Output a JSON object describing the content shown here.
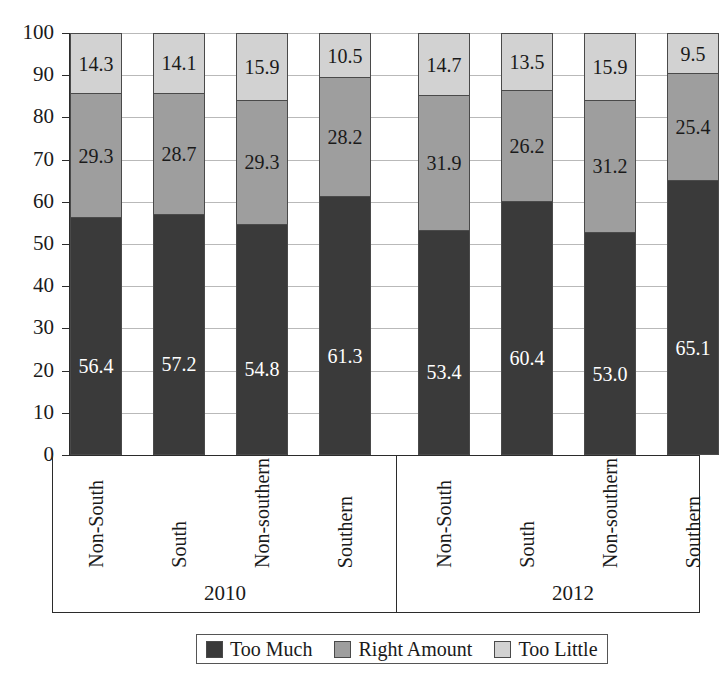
{
  "chart_data": {
    "type": "bar",
    "subtype": "stacked-bar-100",
    "title": "",
    "xlabel": "",
    "ylabel": "",
    "ylim": [
      0,
      100
    ],
    "ytick_labels": [
      "100",
      "90",
      "80",
      "70",
      "60",
      "50",
      "40",
      "30",
      "20",
      "10",
      "0"
    ],
    "ytick_values": [
      100,
      90,
      80,
      70,
      60,
      50,
      40,
      30,
      20,
      10,
      0
    ],
    "grid": true,
    "legend_position": "bottom",
    "groups": [
      "2010",
      "2012"
    ],
    "categories": [
      "Non-South",
      "South",
      "Non-southern",
      "Southern",
      "Non-South",
      "South",
      "Non-southern",
      "Southern"
    ],
    "series": [
      {
        "name": "Too Much",
        "color": "#3a3a3a",
        "values": [
          56.4,
          57.2,
          54.8,
          61.3,
          53.4,
          60.4,
          53.0,
          65.1
        ],
        "labels": [
          "56.4",
          "57.2",
          "54.8",
          "61.3",
          "53.4",
          "60.4",
          "53.0",
          "65.1"
        ]
      },
      {
        "name": "Right Amount",
        "color": "#9e9e9e",
        "values": [
          29.3,
          28.7,
          29.3,
          28.2,
          31.9,
          26.2,
          31.2,
          25.4
        ],
        "labels": [
          "29.3",
          "28.7",
          "29.3",
          "28.2",
          "31.9",
          "26.2",
          "31.2",
          "25.4"
        ]
      },
      {
        "name": "Too Little",
        "color": "#d2d2d2",
        "values": [
          14.3,
          14.1,
          15.9,
          10.5,
          14.7,
          13.5,
          15.9,
          9.5
        ],
        "labels": [
          "14.3",
          "14.1",
          "15.9",
          "10.5",
          "14.7",
          "13.5",
          "15.9",
          "9.5"
        ]
      }
    ]
  },
  "axis": {
    "ticks": [
      {
        "label": "100",
        "value": 100
      },
      {
        "label": "90",
        "value": 90
      },
      {
        "label": "80",
        "value": 80
      },
      {
        "label": "70",
        "value": 70
      },
      {
        "label": "60",
        "value": 60
      },
      {
        "label": "50",
        "value": 50
      },
      {
        "label": "40",
        "value": 40
      },
      {
        "label": "30",
        "value": 30
      },
      {
        "label": "20",
        "value": 20
      },
      {
        "label": "10",
        "value": 10
      },
      {
        "label": "0",
        "value": 0
      }
    ]
  },
  "bars": [
    {
      "group": "2010",
      "category": "Non-South",
      "too_much": "56.4",
      "right_amount": "29.3",
      "too_little": "14.3"
    },
    {
      "group": "2010",
      "category": "South",
      "too_much": "57.2",
      "right_amount": "28.7",
      "too_little": "14.1"
    },
    {
      "group": "2010",
      "category": "Non-southern",
      "too_much": "54.8",
      "right_amount": "29.3",
      "too_little": "15.9"
    },
    {
      "group": "2010",
      "category": "Southern",
      "too_much": "61.3",
      "right_amount": "28.2",
      "too_little": "10.5"
    },
    {
      "group": "2012",
      "category": "Non-South",
      "too_much": "53.4",
      "right_amount": "31.9",
      "too_little": "14.7"
    },
    {
      "group": "2012",
      "category": "South",
      "too_much": "60.4",
      "right_amount": "26.2",
      "too_little": "13.5"
    },
    {
      "group": "2012",
      "category": "Non-southern",
      "too_much": "53.0",
      "right_amount": "31.2",
      "too_little": "15.9"
    },
    {
      "group": "2012",
      "category": "Southern",
      "too_much": "65.1",
      "right_amount": "25.4",
      "too_little": "9.5"
    }
  ],
  "group_labels": [
    {
      "label": "2010"
    },
    {
      "label": "2012"
    }
  ],
  "legend": {
    "items": [
      {
        "label": "Too Much",
        "color": "#3a3a3a"
      },
      {
        "label": "Right Amount",
        "color": "#9e9e9e"
      },
      {
        "label": "Too Little",
        "color": "#d2d2d2"
      }
    ]
  }
}
